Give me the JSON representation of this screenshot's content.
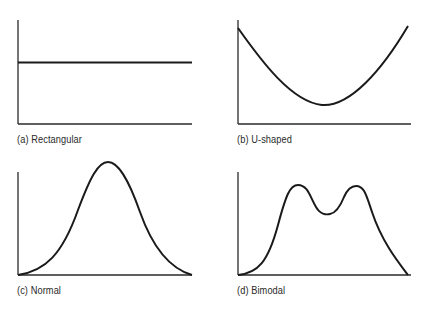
{
  "figure": {
    "panels": [
      {
        "id": "a",
        "label": "(a) Rectangular",
        "shape": "rectangular"
      },
      {
        "id": "b",
        "label": "(b) U-shaped",
        "shape": "u-shaped"
      },
      {
        "id": "c",
        "label": "(c) Normal",
        "shape": "normal"
      },
      {
        "id": "d",
        "label": "(d) Bimodal",
        "shape": "bimodal"
      }
    ],
    "colors": {
      "line": "#1a1a1a",
      "axis": "#2a2a2a",
      "background": "#ffffff"
    }
  }
}
